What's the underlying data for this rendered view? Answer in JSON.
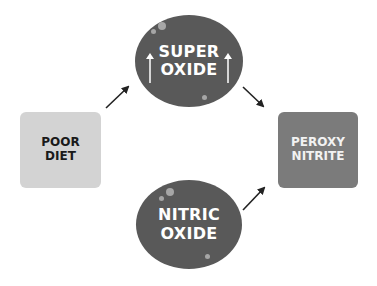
{
  "diagram": {
    "nodes": {
      "poor_diet": {
        "line1": "POOR",
        "line2": "DIET",
        "shape": "rounded-square",
        "color": "#d3d3d3",
        "text_color": "#1a1a1a"
      },
      "superoxide": {
        "line1": "SUPER",
        "line2": "OXIDE",
        "shape": "circle",
        "color": "#595959",
        "text_color": "#ffffff",
        "indicator_icons": [
          "up-arrow-icon",
          "up-arrow-icon"
        ]
      },
      "nitric_oxide": {
        "line1": "NITRIC",
        "line2": "OXIDE",
        "shape": "circle",
        "color": "#595959",
        "text_color": "#ffffff"
      },
      "peroxynitrite": {
        "line1": "PEROXY",
        "line2": "NITRITE",
        "shape": "rounded-square",
        "color": "#7b7b7b",
        "text_color": "#f2f2f2"
      }
    },
    "edges": [
      {
        "from": "POOR DIET",
        "to": "SUPER OXIDE"
      },
      {
        "from": "SUPER OXIDE",
        "to": "PEROXY NITRITE"
      },
      {
        "from": "NITRIC OXIDE",
        "to": "PEROXY NITRITE"
      }
    ]
  }
}
